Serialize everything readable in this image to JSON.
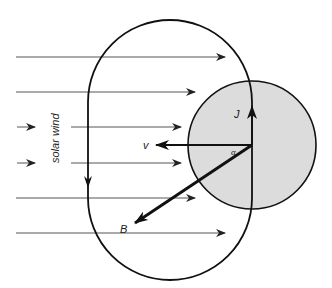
{
  "diagram": {
    "labels": {
      "solar_wind": "solar wind",
      "current": "J",
      "velocity": "v",
      "field": "B",
      "angle": "α"
    },
    "colors": {
      "circle_fill": "#dcdcdc",
      "stroke": "#111111",
      "flow_lines": "#555555"
    },
    "flow_lines_count": 6,
    "elements": [
      "current loop (stadium shape)",
      "shaded circle",
      "solar wind flow arrows",
      "J vector (up)",
      "v vector (left)",
      "B vector (down-left)",
      "angle alpha between v and B"
    ]
  }
}
